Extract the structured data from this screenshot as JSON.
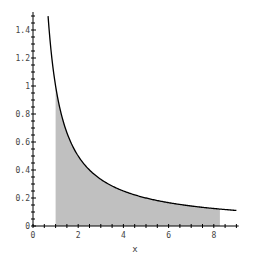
{
  "chart_data": {
    "type": "area",
    "title": "",
    "xlabel": "x",
    "ylabel": "",
    "function": "1/x",
    "xlim": [
      0,
      9
    ],
    "ylim": [
      0,
      1.5
    ],
    "grid": false,
    "legend": null,
    "x_ticks": [
      0,
      2,
      4,
      6,
      8
    ],
    "x_tick_labels": [
      "0",
      "2",
      "4",
      "6",
      "8"
    ],
    "y_ticks": [
      0,
      0.2,
      0.4,
      0.6,
      0.8,
      1,
      1.2,
      1.4
    ],
    "y_tick_labels": [
      "0",
      "0.2",
      "0.4",
      "0.6",
      "0.8",
      "1",
      "1.2",
      "1.4"
    ],
    "curve": {
      "x_start": 0.667,
      "x_end": 9,
      "color": "#000000",
      "points": [
        [
          0.667,
          1.5
        ],
        [
          0.75,
          1.333
        ],
        [
          1,
          1
        ],
        [
          1.5,
          0.667
        ],
        [
          2,
          0.5
        ],
        [
          2.5,
          0.4
        ],
        [
          3,
          0.333
        ],
        [
          4,
          0.25
        ],
        [
          5,
          0.2
        ],
        [
          6,
          0.167
        ],
        [
          7,
          0.143
        ],
        [
          8,
          0.125
        ],
        [
          9,
          0.111
        ]
      ]
    },
    "shaded_region": {
      "x_from": 1,
      "x_to": 8.27,
      "under": "curve",
      "color": "#c0c0c0"
    }
  },
  "labels": {
    "x_axis": "x"
  }
}
